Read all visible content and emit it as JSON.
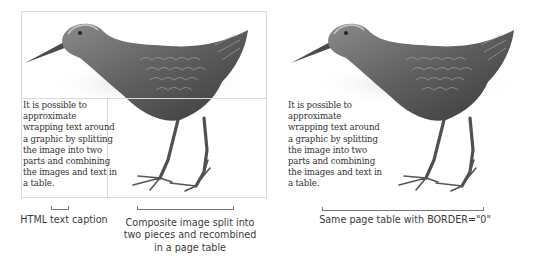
{
  "left_figure": {
    "paragraph_lines": [
      "It is possible to",
      "approximate",
      "wrapping text around",
      "a graphic by splitting",
      "the image into two",
      "parts and combining",
      "the images and text in",
      "a table."
    ],
    "table_border": "visible",
    "border_color": "#d9d9d9"
  },
  "right_figure": {
    "paragraph_lines": [
      "It is possible to",
      "approximate",
      "wrapping text around",
      "a graphic by splitting",
      "the image into two",
      "parts and combining",
      "the images and text in",
      "a table."
    ],
    "table_border": "none"
  },
  "captions": {
    "html_text_caption": "HTML text caption",
    "composite_caption_lines": [
      "Composite image split into",
      "two pieces and recombined",
      "in a page table"
    ],
    "border_zero_caption": "Same page table with BORDER=\"0\""
  },
  "icons": {
    "bird": "rail-bird-illustration"
  },
  "colors": {
    "bird_dark": "#3f3f3f",
    "bird_mid": "#6e6e6e",
    "bird_light": "#a8a8a8",
    "text": "#333333"
  }
}
